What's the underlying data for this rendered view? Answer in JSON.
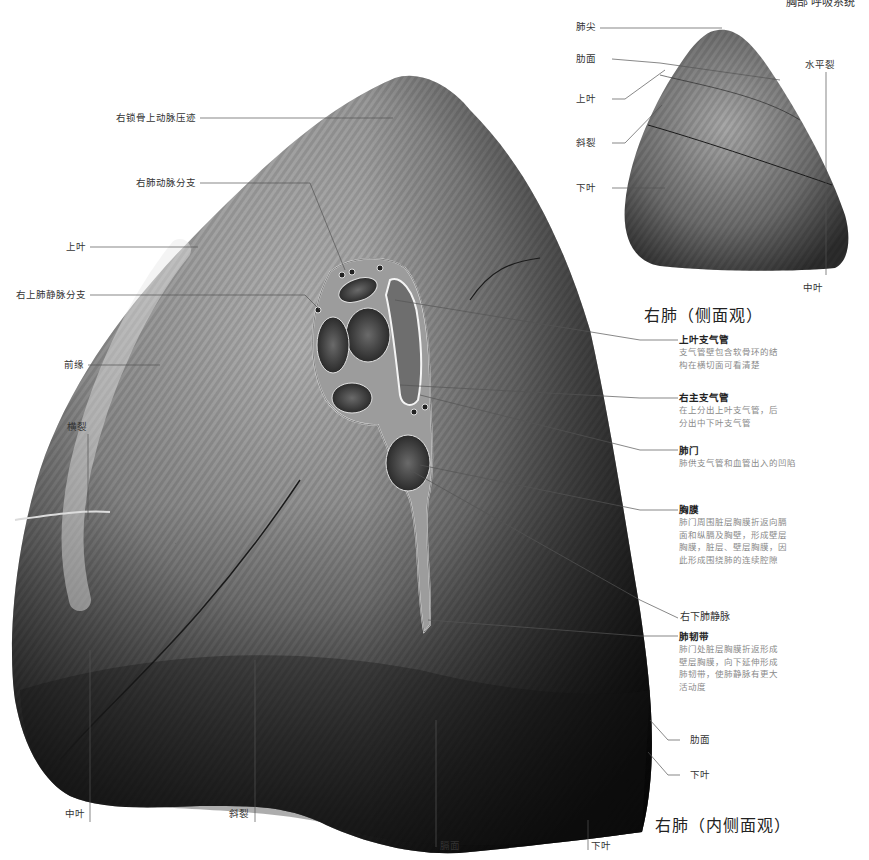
{
  "header": {
    "section": "胸部  呼吸系统"
  },
  "lateral_view": {
    "title": "右肺（侧面观）",
    "labels": {
      "apex": "肺尖",
      "costal_surface": "肋面",
      "upper_lobe": "上叶",
      "oblique_fissure": "斜裂",
      "lower_lobe": "下叶",
      "horizontal_fissure": "水平裂",
      "middle_lobe": "中叶"
    }
  },
  "medial_view": {
    "title": "右肺（内侧面观）",
    "left_labels": {
      "subclavian_groove": "右锁骨上动脉压迹",
      "pulmonary_artery_branch": "右肺动脉分支",
      "upper_lobe": "上叶",
      "superior_pulmonary_vein_branch": "右上肺静脉分支",
      "anterior_border": "前缘",
      "transverse_fissure": "横裂"
    },
    "bottom_labels": {
      "middle_lobe": "中叶",
      "oblique_fissure": "斜裂",
      "diaphragmatic_surface": "膈面",
      "lower_lobe": "下叶"
    },
    "right_labels": {
      "costal_surface": "肋面",
      "lower_lobe": "下叶",
      "inferior_pulmonary_vein": "右下肺静脉"
    },
    "annotations": [
      {
        "title": "上叶支气管",
        "desc": "支气管壁包含软骨环的结\n构在横切面可看清楚"
      },
      {
        "title": "右主支气管",
        "desc": "在上分出上叶支气管，后\n分出中下叶支气管"
      },
      {
        "title": "肺门",
        "desc": "肺供支气管和血管出入的凹陷"
      },
      {
        "title": "胸膜",
        "desc": "肺门周围脏层胸膜折返向膈\n面和纵膈及胸壁，形成壁层\n胸膜，脏层、壁层胸膜，因\n此形成围绕肺的连续腔隙"
      },
      {
        "title": "肺韧带",
        "desc": "肺门处脏层胸膜折返形成\n壁层胸膜，向下延伸形成\n肺韧带，使肺静脉有更大\n活动度"
      }
    ]
  },
  "colors": {
    "lung_light": "#b8b8b8",
    "lung_mid": "#7a7a7a",
    "lung_dark": "#2e2e2e",
    "leader": "#444444"
  }
}
